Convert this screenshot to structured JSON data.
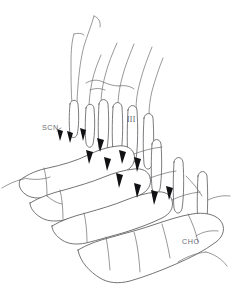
{
  "figure": {
    "type": "line-drawing",
    "background_color": "#ffffff",
    "line_color": "#5b5b5f",
    "marker_color": "#111114",
    "label_color": "#6d6d72",
    "width": 239,
    "height": 299
  },
  "labels": [
    {
      "id": "scn",
      "text": "SCN",
      "x": 42,
      "y": 130,
      "pointer": true,
      "style": "sans"
    },
    {
      "id": "roman-three",
      "text": "III",
      "x": 127,
      "y": 122,
      "pointer": false,
      "style": "serif"
    },
    {
      "id": "cho",
      "text": "CHO",
      "x": 182,
      "y": 244,
      "pointer": false,
      "style": "sans"
    }
  ],
  "markers": {
    "name": "filled-arrowhead-markers",
    "count": 12,
    "color": "#111114"
  },
  "legend": {
    "scn_full": "SCN",
    "cho_full": "CHO",
    "roman_numeral": "III"
  }
}
